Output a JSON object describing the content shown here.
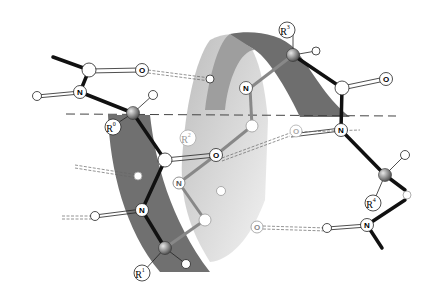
{
  "diagram": {
    "type": "alpha-helix-ball-and-stick",
    "ribbon_colors": {
      "dark": "#6e6e6e",
      "mid": "#9a9a9a",
      "light": "#d8d8d8"
    },
    "atom_labels": {
      "N": "N",
      "O": "O"
    },
    "residue_labels": {
      "r0": {
        "base": "R",
        "sup": "0"
      },
      "r1": {
        "base": "R",
        "sup": "1"
      },
      "r2": {
        "base": "R",
        "sup": "2"
      },
      "r3": {
        "base": "R",
        "sup": "3"
      },
      "r4": {
        "base": "R",
        "sup": "4"
      }
    },
    "axis_line": "dashed helix axis"
  }
}
